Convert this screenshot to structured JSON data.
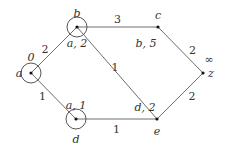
{
  "diagram": {
    "type": "weighted-graph",
    "nodes": [
      {
        "id": "a",
        "name": "a",
        "label": "0",
        "circled": true
      },
      {
        "id": "b",
        "name": "b",
        "label": "a, 2",
        "circled": true
      },
      {
        "id": "c",
        "name": "c",
        "label": "b, 5",
        "circled": false
      },
      {
        "id": "d",
        "name": "d",
        "label": "a, 1",
        "circled": true
      },
      {
        "id": "e",
        "name": "e",
        "label": "d, 2",
        "circled": false
      },
      {
        "id": "z",
        "name": "z",
        "label": "∞",
        "circled": false
      }
    ],
    "edges": [
      {
        "from": "a",
        "to": "b",
        "weight": "2"
      },
      {
        "from": "a",
        "to": "d",
        "weight": "1"
      },
      {
        "from": "b",
        "to": "c",
        "weight": "3"
      },
      {
        "from": "b",
        "to": "e",
        "weight": "1"
      },
      {
        "from": "d",
        "to": "e",
        "weight": "1"
      },
      {
        "from": "c",
        "to": "z",
        "weight": "2"
      },
      {
        "from": "e",
        "to": "z",
        "weight": "2"
      }
    ]
  }
}
